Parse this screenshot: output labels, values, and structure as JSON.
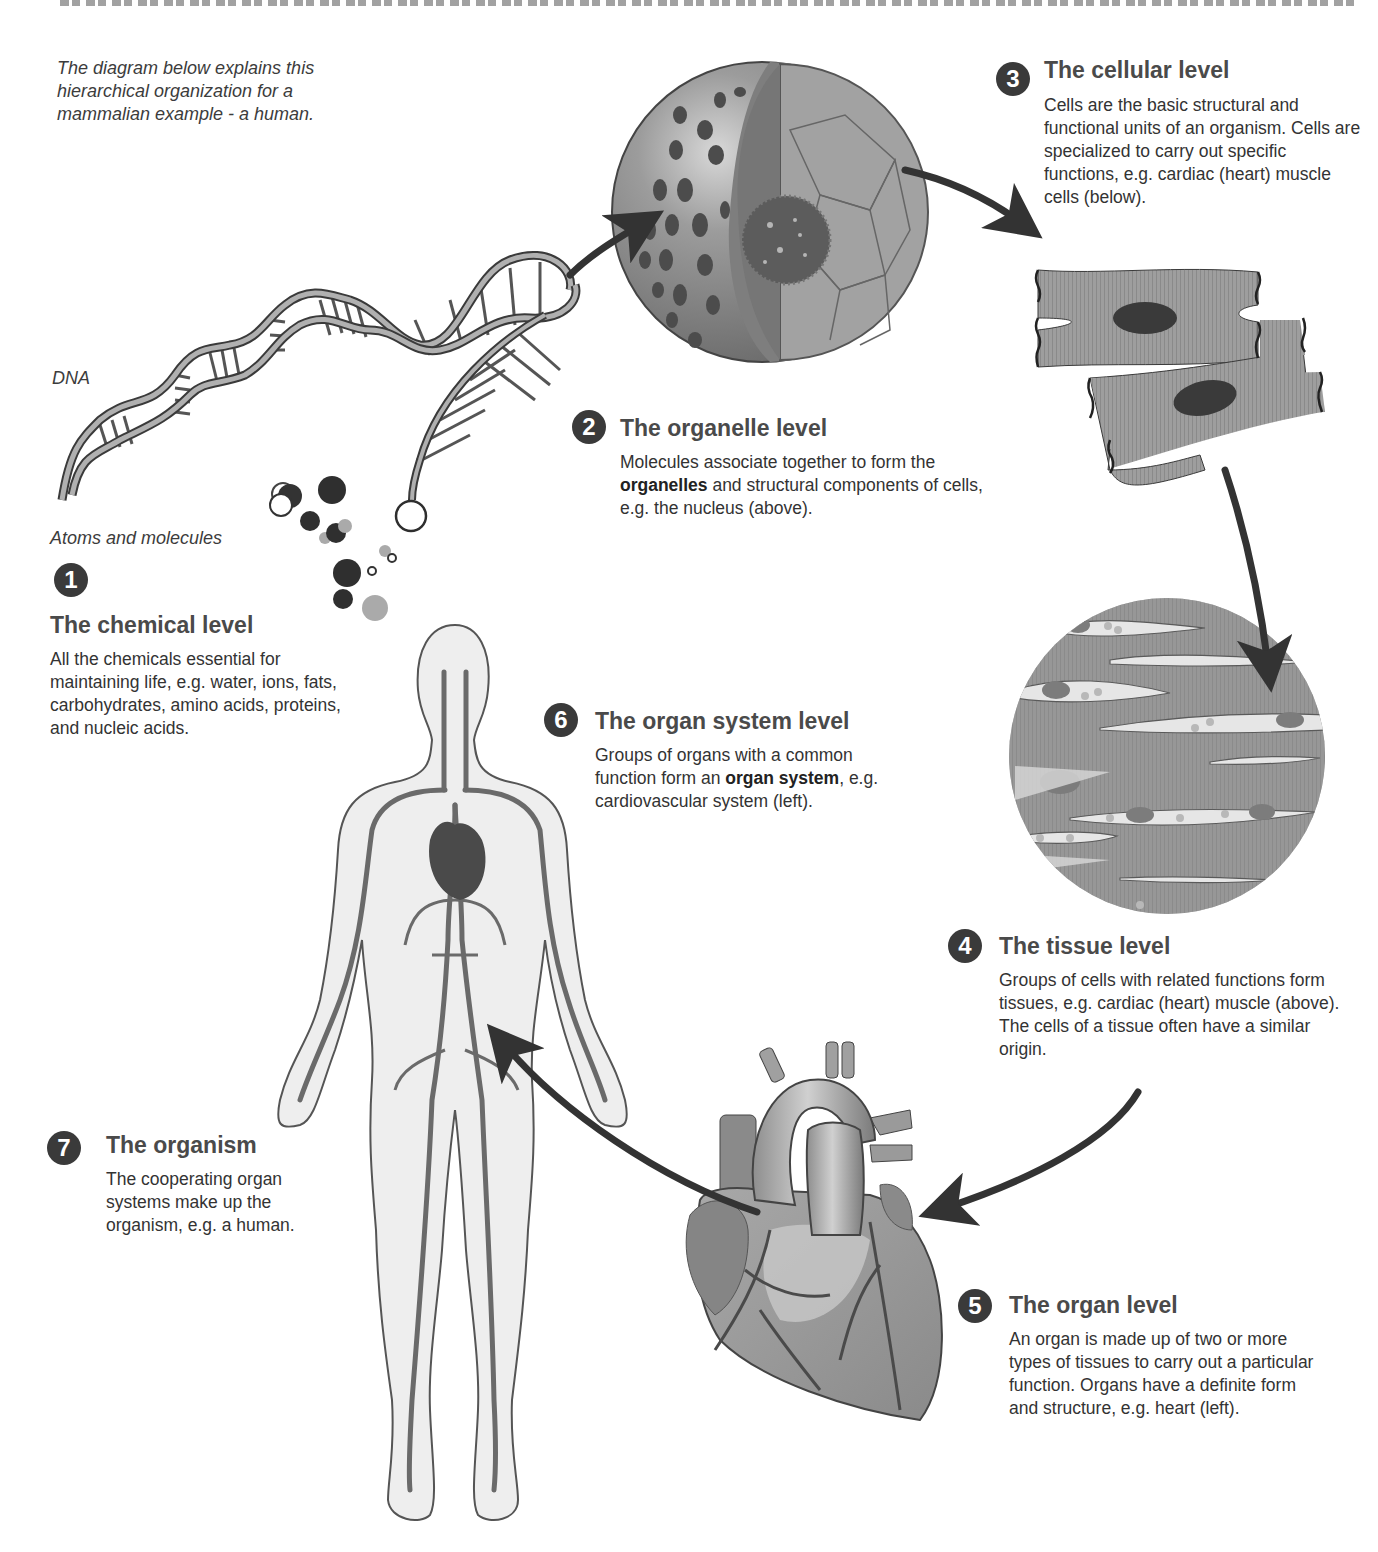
{
  "intro": {
    "note": "The diagram below explains this hierarchical organization for a mammalian example - a human."
  },
  "labels": {
    "dna": "DNA",
    "atoms_molecules": "Atoms and molecules"
  },
  "levels": [
    {
      "number": "1",
      "title": "The chemical level",
      "description": "All the chemicals essential for maintaining life, e.g. water, ions, fats, carbohydrates, amino acids, proteins, and nucleic acids."
    },
    {
      "number": "2",
      "title": "The organelle level",
      "description_pre": "Molecules associate together to form the ",
      "description_bold": "organelles",
      "description_post": " and structural components of cells, e.g. the nucleus (above)."
    },
    {
      "number": "3",
      "title": "The cellular level",
      "description": "Cells are the basic structural and functional units of an organism. Cells are specialized to carry out specific functions, e.g. cardiac (heart) muscle cells (below)."
    },
    {
      "number": "4",
      "title": "The tissue level",
      "description": "Groups of cells with related functions form tissues, e.g. cardiac (heart) muscle (above). The cells of a tissue often have a similar origin."
    },
    {
      "number": "5",
      "title": "The organ level",
      "description": "An organ is made up of two or more types of tissues to carry out a particular function. Organs have a definite form and structure, e.g. heart (left)."
    },
    {
      "number": "6",
      "title": "The organ system level",
      "description_pre": "Groups of organs with a common function form an ",
      "description_bold": "organ system",
      "description_post": ", e.g. cardiovascular system (left)."
    },
    {
      "number": "7",
      "title": "The organism",
      "description": "The cooperating organ systems make up the organism, e.g. a human."
    }
  ],
  "illustrations": {
    "dna": "dna-double-helix",
    "atoms": "atoms-and-molecules-cluster",
    "nucleus": "cut-away-nucleus",
    "cells": "cardiac-muscle-cells",
    "tissue": "cardiac-muscle-tissue",
    "heart": "human-heart",
    "body": "human-cardiovascular-system"
  },
  "colors": {
    "badge": "#3a3a3a",
    "title": "#4a4a4a",
    "text": "#333333",
    "illustration_gray": "#9a9a9a",
    "illustration_dark": "#4a4a4a",
    "arrow": "#333333"
  }
}
